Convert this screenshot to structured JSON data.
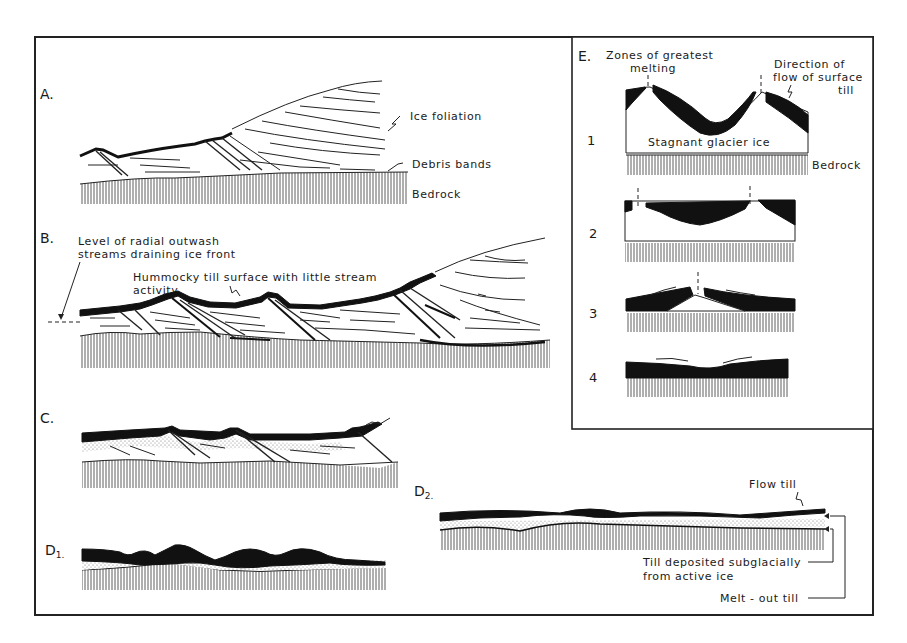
{
  "figure": {
    "panels": {
      "A": {
        "label": "A.",
        "annotations": {
          "ice_foliation": "Ice foliation",
          "debris_bands": "Debris bands",
          "bedrock": "Bedrock"
        }
      },
      "B": {
        "label": "B.",
        "annotations": {
          "outwash_line1": "Level of radial outwash",
          "outwash_line2": "streams draining ice front",
          "hummocky_line1": "Hummocky till surface with little stream",
          "hummocky_line2": "activity"
        }
      },
      "C": {
        "label": "C."
      },
      "D1": {
        "label": "D",
        "subscript": "1."
      },
      "D2": {
        "label": "D",
        "subscript": "2.",
        "annotations": {
          "flow_till": "Flow till",
          "subglacial_line1": "Till deposited subglacially",
          "subglacial_line2": "from active ice",
          "meltout_till": "Melt - out till"
        }
      },
      "E": {
        "label": "E.",
        "annotations": {
          "zones_line1": "Zones of greatest",
          "zones_line2": "melting",
          "direction_line1": "Direction of",
          "direction_line2": "flow of surface",
          "direction_line3": "till",
          "stagnant_ice": "Stagnant glacier ice",
          "bedrock": "Bedrock"
        },
        "stages": [
          "1",
          "2",
          "3",
          "4"
        ]
      }
    }
  }
}
